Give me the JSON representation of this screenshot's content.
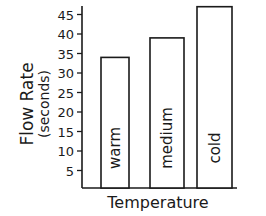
{
  "chart_data": {
    "type": "bar",
    "title": "",
    "xlabel": "Temperature",
    "ylabel_line1": "Flow Rate",
    "ylabel_line2": "(seconds)",
    "ylabel": "Flow Rate (seconds)",
    "categories": [
      "warm",
      "medium",
      "cold"
    ],
    "values": [
      34,
      39,
      47
    ],
    "yticks": [
      5,
      10,
      15,
      20,
      25,
      30,
      35,
      40,
      45
    ],
    "ylim": [
      0,
      48
    ],
    "grid": false,
    "legend": null,
    "bar_labels_inside_vertical": true,
    "bar_fill": "#ffffff",
    "line_color": "#1a1a1a"
  }
}
